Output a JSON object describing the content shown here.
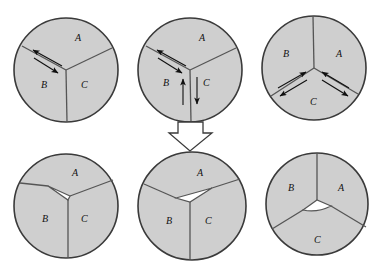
{
  "figure": {
    "title": "",
    "colors": {
      "grain_fill": "#cfcfcf",
      "void_fill": "#ffffff",
      "outline": "#3a3a3a",
      "boundary": "#555555",
      "arrow": "#101010",
      "background": "#ffffff"
    },
    "panels": [
      {
        "id": "top-left",
        "row": "top",
        "column": "left",
        "labels": {
          "a": "A",
          "b": "B",
          "c": "C"
        },
        "arrows": [
          {
            "name": "arrow-ab-outward",
            "direction": "up-left"
          },
          {
            "name": "arrow-ab-inward",
            "direction": "down-right"
          }
        ],
        "void": false
      },
      {
        "id": "top-center",
        "row": "top",
        "column": "center",
        "labels": {
          "a": "A",
          "b": "B",
          "c": "C"
        },
        "arrows": [
          {
            "name": "arrow-ab-outward",
            "direction": "up-left"
          },
          {
            "name": "arrow-ab-inward",
            "direction": "down-right"
          },
          {
            "name": "arrow-b-up",
            "direction": "up"
          },
          {
            "name": "arrow-c-down",
            "direction": "down"
          }
        ],
        "void": false
      },
      {
        "id": "top-right",
        "row": "top",
        "column": "right",
        "labels": {
          "a": "A",
          "b": "B",
          "c": "C"
        },
        "arrows": [
          {
            "name": "arrow-bc-inward",
            "direction": "up-right"
          },
          {
            "name": "arrow-bc-outward",
            "direction": "down-left"
          },
          {
            "name": "arrow-ac-inward",
            "direction": "up-left"
          },
          {
            "name": "arrow-ac-outward",
            "direction": "down-right"
          }
        ],
        "void": false
      },
      {
        "id": "bottom-left",
        "row": "bottom",
        "column": "left",
        "labels": {
          "a": "A",
          "b": "B",
          "c": "C"
        },
        "arrows": [],
        "void": true,
        "void_shape": "wedge-left"
      },
      {
        "id": "bottom-center",
        "row": "bottom",
        "column": "center",
        "labels": {
          "a": "A",
          "b": "B",
          "c": "C"
        },
        "arrows": [],
        "void": true,
        "void_shape": "wedge-right"
      },
      {
        "id": "bottom-right",
        "row": "bottom",
        "column": "right",
        "labels": {
          "a": "A",
          "b": "B",
          "c": "C"
        },
        "arrows": [],
        "void": true,
        "void_shape": "wedge-lens"
      }
    ],
    "transition_arrow": {
      "name": "block-arrow-down",
      "direction": "down",
      "from_panel": "top-center",
      "to_panel": "bottom-center"
    }
  }
}
